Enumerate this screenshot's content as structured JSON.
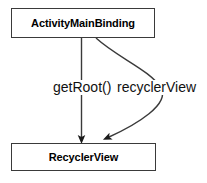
{
  "diagram": {
    "type": "uml-object-relationship",
    "background_color": "#ffffff",
    "stroke_color": "#3a3a3a",
    "text_color": "#000000",
    "nodes": [
      {
        "id": "activity-main-binding",
        "label": "ActivityMainBinding",
        "shape": "rectangle",
        "x": 11,
        "y": 8,
        "width": 144,
        "height": 30
      },
      {
        "id": "recycler-view",
        "label": "RecyclerView",
        "shape": "rectangle",
        "x": 11,
        "y": 143,
        "width": 145,
        "height": 28
      }
    ],
    "edges": [
      {
        "id": "get-root",
        "label": "getRoot()",
        "from": "activity-main-binding",
        "to": "recycler-view",
        "style": "straight",
        "arrowhead": "filled-triangle"
      },
      {
        "id": "recycler-view-field",
        "label": "recyclerView",
        "from": "activity-main-binding",
        "to": "recycler-view",
        "style": "curved",
        "arrowhead": "filled-triangle"
      }
    ]
  }
}
